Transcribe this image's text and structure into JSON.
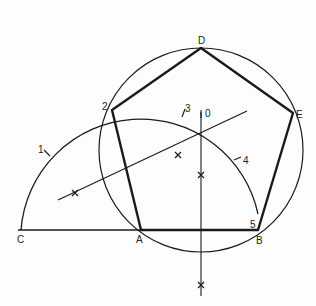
{
  "diagram": {
    "colors": {
      "stroke": "#1a1a1a",
      "background": "#fdfdfd"
    },
    "points": {
      "C": {
        "label": "C",
        "x": 21,
        "y": 230
      },
      "A": {
        "label": "A",
        "x": 141,
        "y": 230
      },
      "B": {
        "label": "B",
        "x": 258,
        "y": 230
      },
      "D": {
        "label": "D",
        "x": 201,
        "y": 48
      },
      "E": {
        "label": "E",
        "x": 293,
        "y": 113
      },
      "O": {
        "label": "0",
        "x": 203,
        "y": 117
      },
      "p1": {
        "label": "1",
        "x": 47,
        "y": 153
      },
      "p2": {
        "label": "2",
        "x": 112,
        "y": 110
      },
      "p3": {
        "label": "3",
        "x": 183,
        "y": 113
      },
      "p4": {
        "label": "4",
        "x": 238,
        "y": 159
      },
      "p5": {
        "label": "5",
        "x": 258,
        "y": 230
      }
    },
    "labels": [
      "C",
      "A",
      "B",
      "D",
      "E",
      "0",
      "1",
      "2",
      "3",
      "4",
      "5"
    ]
  }
}
